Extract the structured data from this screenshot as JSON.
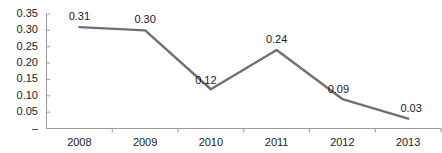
{
  "chart_data": {
    "type": "line",
    "title": "",
    "subtitle": "",
    "xlabel": "",
    "ylabel": "",
    "categories": [
      "2008",
      "2009",
      "2010",
      "2011",
      "2012",
      "2013"
    ],
    "values": [
      0.31,
      0.3,
      0.12,
      0.24,
      0.09,
      0.03
    ],
    "point_labels": [
      "0.31",
      "0.30",
      "0.12",
      "0.24",
      "0.09",
      "0.03"
    ],
    "series": [
      {
        "name": "",
        "values": [
          0.31,
          0.3,
          0.12,
          0.24,
          0.09,
          0.03
        ]
      }
    ],
    "ylim": [
      0,
      0.35
    ],
    "ytick_values": [
      0.35,
      0.3,
      0.25,
      0.2,
      0.15,
      0.1,
      0.05,
      0
    ],
    "ytick_labels": [
      "0.35",
      "0.30",
      "0.25",
      "0.20",
      "0.15",
      "0.10",
      "0.05",
      "–"
    ],
    "xtick_labels": [
      "2008",
      "2009",
      "2010",
      "2011",
      "2012",
      "2013"
    ],
    "grid": false,
    "legend": false,
    "legend_position": "none",
    "markers": false,
    "line_color": "#707070",
    "axis_color": "#9a9a9a",
    "text_color": "#222222",
    "background_color": "#ffffff"
  },
  "axes": {
    "y_axis_name": "value-axis",
    "x_axis_name": "year-axis"
  }
}
